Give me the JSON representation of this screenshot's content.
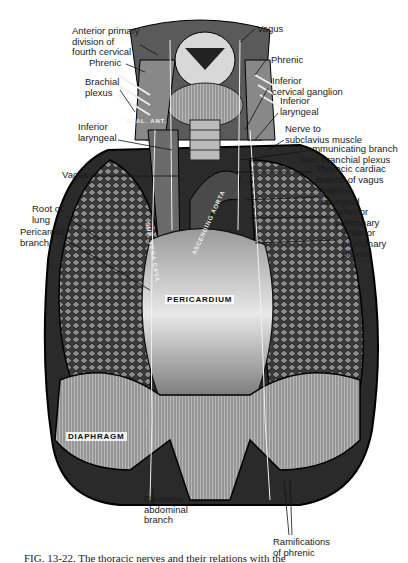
{
  "figure": {
    "caption": "FIG. 13-22. The thoracic nerves and their relations with the",
    "organs": {
      "pericardium": "PERICARDIUM",
      "diaphragm": "DIAPHRAGM",
      "scalenus_ant": "SCAL. ANT.",
      "sup_vena_cava": "SUP. VENA CAVA",
      "ascending_aorta": "ASCENDING AORTA"
    },
    "labels_left": [
      {
        "id": "anterior-primary-division",
        "text": "Anterior primary\ndivision of\nfourth cervical"
      },
      {
        "id": "phrenic-left",
        "text": "Phrenic"
      },
      {
        "id": "brachial-plexus",
        "text": "Brachial\nplexus"
      },
      {
        "id": "inferior-laryngeal-left",
        "text": "Inferior\nlaryngeal"
      },
      {
        "id": "vagus-left",
        "text": "Vagus"
      },
      {
        "id": "root-of-lung",
        "text": "Root of\nlung"
      },
      {
        "id": "pericardial-branch",
        "text": "Pericardial\nbranch"
      }
    ],
    "labels_right": [
      {
        "id": "vagus-right",
        "text": "Vagus"
      },
      {
        "id": "phrenic-right",
        "text": "Phrenic"
      },
      {
        "id": "inferior-cervical-ganglion",
        "text": "Inferior\ncervical ganglion"
      },
      {
        "id": "inferior-laryngeal-right",
        "text": "Inferior\nlaryngeal"
      },
      {
        "id": "nerve-to-subclavius",
        "text": "Nerve to\nsubclavius muscle"
      },
      {
        "id": "communicating-branch",
        "text": "Communicating branch\nfrom branchial plexus"
      },
      {
        "id": "thoracic-cardiac-branch",
        "text": "Thoracic cardiac\nbranch of vagus"
      },
      {
        "id": "inferior-laryngeal-lower",
        "text": "Inferior\nlaryngeal"
      },
      {
        "id": "anterior-pulmonary",
        "text": "Anterior\npulmonary"
      },
      {
        "id": "anterior-pulmonary-plexus",
        "text": "Anterior\npulmonary\nplexus"
      }
    ],
    "labels_bottom": [
      {
        "id": "phrenico-abdominal-branch",
        "text": "Phrenico-\nabdominal\nbranch"
      },
      {
        "id": "ramifications-of-phrenic",
        "text": "Ramifications\nof phrenic"
      }
    ]
  }
}
